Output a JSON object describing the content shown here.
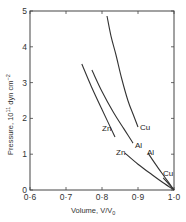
{
  "chart_data": {
    "type": "line",
    "title": "",
    "xlabel": "Volume, V/V0",
    "ylabel": "Pressure, 10^11 dyn cm^-2",
    "xlim": [
      0.6,
      1.0
    ],
    "ylim": [
      0,
      5
    ],
    "x_ticks": [
      "0·6",
      "0·7",
      "0·8",
      "0·9",
      "1·0"
    ],
    "y_ticks": [
      "0",
      "1",
      "2",
      "3",
      "4",
      "5"
    ],
    "grid": false,
    "legend": "inline labels",
    "series": [
      {
        "name": "Cu (upper)",
        "label": "Cu",
        "points": [
          [
            0.814,
            4.86
          ],
          [
            0.825,
            4.3
          ],
          [
            0.839,
            3.77
          ],
          [
            0.855,
            3.1
          ],
          [
            0.872,
            2.5
          ],
          [
            0.887,
            2.1
          ],
          [
            0.9,
            1.76
          ]
        ]
      },
      {
        "name": "Al (upper)",
        "label": "Al",
        "points": [
          [
            0.772,
            3.35
          ],
          [
            0.8,
            2.75
          ],
          [
            0.83,
            2.2
          ],
          [
            0.86,
            1.72
          ],
          [
            0.886,
            1.31
          ]
        ]
      },
      {
        "name": "Zn (upper)",
        "label": "Zn",
        "points": [
          [
            0.744,
            3.52
          ],
          [
            0.77,
            2.9
          ],
          [
            0.8,
            2.25
          ],
          [
            0.836,
            1.48
          ]
        ]
      },
      {
        "name": "Zn (lower)",
        "label": "Zn",
        "points": [
          [
            0.864,
            1.03
          ],
          [
            0.9,
            0.72
          ],
          [
            0.94,
            0.42
          ],
          [
            0.97,
            0.2
          ],
          [
            1.0,
            0
          ]
        ]
      },
      {
        "name": "Al (lower)",
        "label": "Al",
        "points": [
          [
            0.928,
            1.03
          ],
          [
            0.95,
            0.7
          ],
          [
            0.975,
            0.35
          ],
          [
            1.0,
            0
          ]
        ]
      },
      {
        "name": "Cu (lower)",
        "label": "Cu",
        "points": [
          [
            0.97,
            0.34
          ],
          [
            0.985,
            0.17
          ],
          [
            1.0,
            0
          ]
        ]
      }
    ]
  },
  "labels": {
    "xaxis": "Volume, V/V",
    "xaxis_sub": "0",
    "yaxis": "Pressure, 10",
    "yaxis_sup": "11",
    "yaxis_rest": " dyn cm",
    "yaxis_sup2": "−2",
    "cu_upper": "Cu",
    "al_upper": "Al",
    "zn_upper": "Zn",
    "zn_lower": "Zn",
    "al_lower": "Al",
    "cu_lower": "Cu"
  },
  "colors": {
    "line": "#333333",
    "background": "#ffffff"
  }
}
